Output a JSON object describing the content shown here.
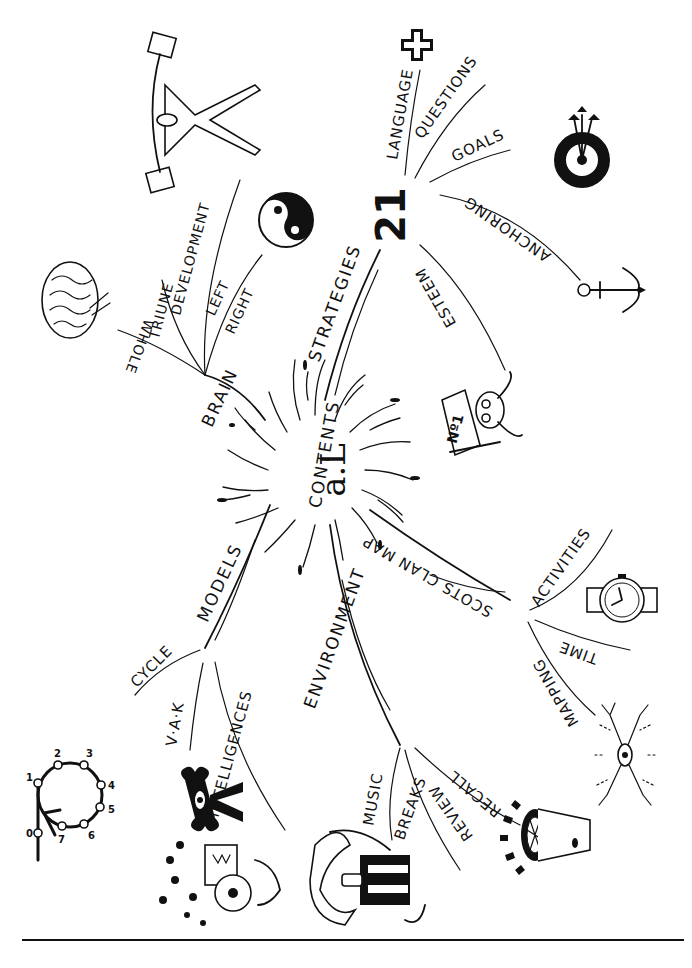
{
  "diagram": {
    "type": "mind-map",
    "center": {
      "title": "CONTENTS",
      "logo": "a.L",
      "logo_icon": "accelerated-learning-logo-icon"
    },
    "branches": [
      {
        "label": "BRAIN",
        "children": [
          "WHOLE",
          "TRIUNE",
          "DEVELOPMENT",
          "LEFT",
          "RIGHT"
        ],
        "icons": [
          "brain-icon",
          "weightlifter-icon",
          "yin-yang-icon"
        ]
      },
      {
        "label": "STRATEGIES",
        "number": "21",
        "children": [
          "LANGUAGE",
          "QUESTIONS",
          "GOALS",
          "ANCHORING",
          "ESTEEM"
        ],
        "icons": [
          "plus-icon",
          "target-with-arrows-icon",
          "anchor-icon",
          "number-one-badge-icon"
        ]
      },
      {
        "label": "SCOTS CLAN MAP",
        "children": [
          "ACTIVITIES",
          "TIME",
          "MAPPING"
        ],
        "icons": [
          "wristwatch-icon",
          "neuron-icon"
        ]
      },
      {
        "label": "ENVIRONMENT",
        "children": [
          "MUSIC",
          "BREAKS",
          "REVIEW",
          "RECALL"
        ],
        "icons": [
          "musician-icon",
          "megaphone-icon"
        ]
      },
      {
        "label": "MODELS",
        "children": [
          "CYCLE",
          "V·A·K",
          "INTELLIGENCES"
        ],
        "icons": [
          "learning-cycle-icon",
          "eye-figure-icon",
          "multiple-intelligences-icon"
        ]
      }
    ],
    "cycle_diagram": {
      "nodes": [
        "0",
        "1",
        "2",
        "3",
        "4",
        "5",
        "6",
        "7"
      ]
    }
  }
}
